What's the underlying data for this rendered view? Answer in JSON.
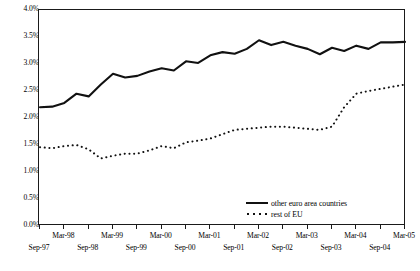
{
  "chart_data": {
    "type": "line",
    "title": "",
    "subtitle": "",
    "xlabel": "",
    "ylabel": "",
    "ylim": [
      0,
      4
    ],
    "yticks": [
      "0.0%",
      "0.5%",
      "1.0%",
      "1.5%",
      "2.0%",
      "2.5%",
      "3.0%",
      "3.5%",
      "4.0%"
    ],
    "ytick_values": [
      0,
      0.5,
      1.0,
      1.5,
      2.0,
      2.5,
      3.0,
      3.5,
      4.0
    ],
    "grid": false,
    "legend_position": "bottom-right",
    "x": [
      "Sep-97",
      "Dec-97",
      "Mar-98",
      "Jun-98",
      "Sep-98",
      "Dec-98",
      "Mar-99",
      "Jun-99",
      "Sep-99",
      "Dec-99",
      "Mar-00",
      "Jun-00",
      "Sep-00",
      "Dec-00",
      "Mar-01",
      "Jun-01",
      "Sep-01",
      "Dec-01",
      "Mar-02",
      "Jun-02",
      "Sep-02",
      "Dec-02",
      "Mar-03",
      "Jun-03",
      "Sep-03",
      "Dec-03",
      "Mar-04",
      "Jun-04",
      "Sep-04",
      "Dec-04",
      "Mar-05"
    ],
    "xtick_labels_upper": [
      "Mar-98",
      "Mar-99",
      "Mar-00",
      "Mar-01",
      "Mar-02",
      "Mar-03",
      "Mar-04",
      "Mar-05"
    ],
    "xtick_labels_lower": [
      "Sep-97",
      "Sep-98",
      "Sep-99",
      "Sep-00",
      "Sep-01",
      "Sep-02",
      "Sep-03",
      "Sep-04"
    ],
    "series": [
      {
        "name": "other euro area countries",
        "style": "solid",
        "color": "#111111",
        "values": [
          2.2,
          2.21,
          2.28,
          2.45,
          2.4,
          2.62,
          2.82,
          2.75,
          2.78,
          2.86,
          2.92,
          2.88,
          3.05,
          3.02,
          3.16,
          3.22,
          3.19,
          3.28,
          3.44,
          3.35,
          3.41,
          3.34,
          3.28,
          3.18,
          3.3,
          3.24,
          3.34,
          3.28,
          3.4,
          3.4,
          3.41
        ]
      },
      {
        "name": "rest of EU",
        "style": "dotted",
        "color": "#111111",
        "values": [
          1.46,
          1.44,
          1.48,
          1.5,
          1.42,
          1.25,
          1.3,
          1.34,
          1.34,
          1.4,
          1.48,
          1.44,
          1.55,
          1.58,
          1.62,
          1.7,
          1.78,
          1.8,
          1.82,
          1.84,
          1.84,
          1.82,
          1.8,
          1.78,
          1.84,
          2.2,
          2.45,
          2.5,
          2.54,
          2.58,
          2.62
        ]
      }
    ]
  },
  "legend": {
    "items": [
      {
        "label": "other euro area countries",
        "style": "solid"
      },
      {
        "label": "rest of EU",
        "style": "dotted"
      }
    ]
  },
  "colors": {
    "axis": "#1a1a1a",
    "line": "#111111",
    "background": "#ffffff"
  }
}
